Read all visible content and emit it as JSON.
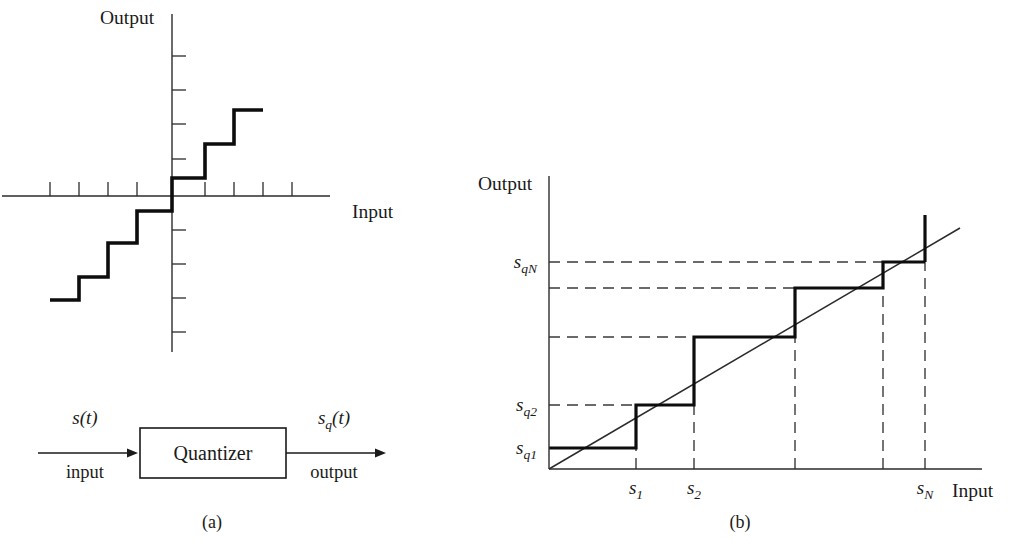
{
  "figure": {
    "caption_a": "(a)",
    "caption_b": "(b)",
    "background_color": "#ffffff",
    "ink_color": "#1a1a1a"
  },
  "panel_a": {
    "name": "uniform-midtread-quantizer-characteristic",
    "y_axis_label": "Output",
    "x_axis_label": "Input",
    "origin": {
      "x": 172,
      "y": 196
    },
    "x_axis": {
      "x1": 2,
      "x2": 330,
      "y": 196
    },
    "y_axis": {
      "x": 172,
      "y1": 14,
      "y2": 352
    },
    "x_tick_positions": [
      50,
      79,
      108,
      137,
      205,
      234,
      263,
      292
    ],
    "x_tick_length": 14,
    "y_tick_positions": [
      56,
      90,
      124,
      159,
      230,
      264,
      298,
      332
    ],
    "y_tick_length": 14,
    "staircase_points": "50,300 79,300 79,277 108,277 108,243 137,243 137,211 172,211 172,178 205,178 205,144 234,144 234,110 263,110"
  },
  "panel_a_diagram": {
    "name": "quantizer-block-diagram",
    "input_signal_label": "s(t)",
    "input_signal_base": "s",
    "input_signal_rest": "(t)",
    "input_caption": "input",
    "block_label": "Quantizer",
    "output_signal_base": "s",
    "output_signal_sub": "q",
    "output_signal_rest": "(t)",
    "output_caption": "output",
    "box": {
      "x": 140,
      "y": 428,
      "width": 146,
      "height": 50
    },
    "input_arrow": {
      "x1": 38,
      "x2": 138,
      "y": 453
    },
    "output_arrow": {
      "x1": 286,
      "x2": 386,
      "y": 453
    }
  },
  "panel_b": {
    "name": "nonuniform-quantizer-characteristic",
    "y_axis_label": "Output",
    "x_axis_label": "Input",
    "origin": {
      "x": 549,
      "y": 469
    },
    "x_axis": {
      "x1": 549,
      "x2": 982,
      "y": 469
    },
    "y_axis": {
      "x": 549,
      "y1": 176,
      "y2": 469
    },
    "diagonal": {
      "x1": 549,
      "y1": 469,
      "x2": 960,
      "y2": 228
    },
    "last_step_spike": {
      "x": 925,
      "y_top": 215,
      "y_bottom": 262
    },
    "step_boundaries_x": [
      549,
      636,
      694,
      795,
      883,
      925
    ],
    "step_levels_y": [
      448,
      405,
      337,
      288,
      262
    ],
    "staircase_points": "549,448 636,448 636,405 694,405 694,337 795,337 795,288 883,288 883,262 925,262",
    "horizontal_dashes": [
      {
        "label": "s_q1",
        "y": 448,
        "x_from": 549,
        "x_to": 549
      },
      {
        "label": "s_q2",
        "y": 405,
        "x_from": 549,
        "x_to": 636
      },
      {
        "label": "",
        "y": 337,
        "x_from": 549,
        "x_to": 694
      },
      {
        "label": "",
        "y": 288,
        "x_from": 549,
        "x_to": 795
      },
      {
        "label": "s_qN",
        "y": 262,
        "x_from": 549,
        "x_to": 925
      }
    ],
    "vertical_dashes": [
      {
        "label": "s1",
        "x": 636,
        "y_from": 469,
        "y_to": 448
      },
      {
        "label": "s2",
        "x": 694,
        "y_from": 469,
        "y_to": 405
      },
      {
        "label": "",
        "x": 795,
        "y_from": 469,
        "y_to": 337
      },
      {
        "label": "",
        "x": 883,
        "y_from": 469,
        "y_to": 288
      },
      {
        "label": "sN",
        "x": 925,
        "y_from": 469,
        "y_to": 262
      }
    ],
    "y_tick_labels": [
      {
        "base": "s",
        "sub": "q1",
        "x": 537,
        "y": 454
      },
      {
        "base": "s",
        "sub": "q2",
        "x": 537,
        "y": 411
      },
      {
        "base": "s",
        "sub": "qN",
        "x": 537,
        "y": 268
      }
    ],
    "x_tick_labels": [
      {
        "base": "s",
        "sub": "1",
        "x": 636,
        "y": 494
      },
      {
        "base": "s",
        "sub": "2",
        "x": 694,
        "y": 494
      },
      {
        "base": "s",
        "sub": "N",
        "x": 925,
        "y": 494
      }
    ]
  },
  "chart_data": {
    "type": "line",
    "charts": [
      {
        "id": "a",
        "type": "line",
        "title": "(a) Uniform quantizer staircase characteristic",
        "xlabel": "Input",
        "ylabel": "Output",
        "description": "Odd-symmetric uniform staircase transfer characteristic through the origin",
        "grid": false,
        "legend": "none",
        "series": [
          {
            "name": "staircase",
            "step_levels": [
              -4,
              -3,
              -2,
              -1,
              1,
              2,
              3
            ],
            "step_edges": [
              -4.2,
              -3.2,
              -2.2,
              -1.2,
              0,
              1,
              2,
              3.1
            ]
          }
        ]
      },
      {
        "id": "b",
        "type": "line",
        "title": "(b) Nonuniform quantizer characteristic",
        "xlabel": "Input",
        "ylabel": "Output",
        "description": "Nonuniform staircase with decision levels s1..sN and reconstruction levels sq1..sqN, shown with the ideal identity line",
        "grid": false,
        "legend": "none",
        "axis_ranges": {
          "x": [
            0,
            1
          ],
          "y": [
            0,
            1
          ]
        },
        "series": [
          {
            "name": "staircase",
            "decision_levels": [
              "s1",
              "s2",
              "",
              "",
              "sN"
            ],
            "decision_levels_x": [
              0.23,
              0.38,
              0.64,
              0.87,
              0.98
            ],
            "reconstruction_levels": [
              "sq1",
              "sq2",
              "",
              "",
              "sqN"
            ],
            "reconstruction_levels_y": [
              0.07,
              0.22,
              0.45,
              0.62,
              0.71
            ]
          },
          {
            "name": "identity-line",
            "x": [
              0,
              1
            ],
            "y": [
              0,
              0.82
            ]
          }
        ]
      }
    ]
  }
}
